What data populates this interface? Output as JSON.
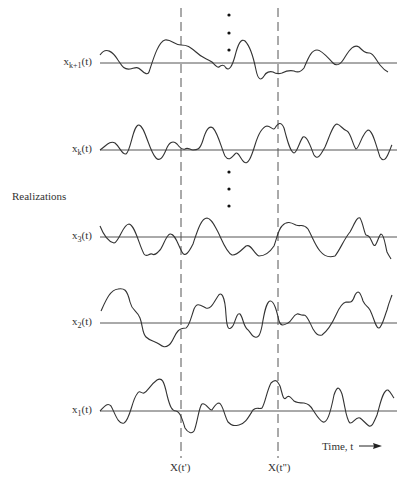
{
  "figure": {
    "side_label": "Realizations",
    "time_axis_label": "Time, t",
    "time_arrow_icon": "right-arrow",
    "line_color": "#333333",
    "realizations": [
      {
        "base": "x",
        "sub": "k+1",
        "arg": "(t)"
      },
      {
        "base": "x",
        "sub": "k",
        "arg": "(t)"
      },
      {
        "base": "x",
        "sub": "3",
        "arg": "(t)"
      },
      {
        "base": "x",
        "sub": "2",
        "arg": "(t)"
      },
      {
        "base": "x",
        "sub": "1",
        "arg": "(t)"
      }
    ],
    "sample_times": [
      {
        "label": "X(t')"
      },
      {
        "label": "X(t'')"
      }
    ],
    "ellipsis_groups": 2
  }
}
